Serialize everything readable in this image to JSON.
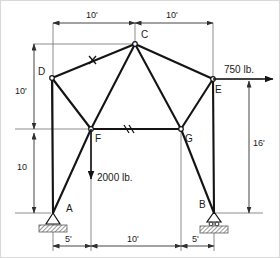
{
  "diagram": {
    "colors": {
      "member": "#141414",
      "dimension": "#3c3c3c",
      "ground_hatch": "#8a8a8a",
      "background": "#ffffff"
    },
    "joints": [
      {
        "id": "A",
        "label": "A",
        "x": 52,
        "y": 212,
        "support": "pin"
      },
      {
        "id": "B",
        "label": "B",
        "x": 213,
        "y": 212,
        "support": "roller"
      },
      {
        "id": "C",
        "label": "C",
        "x": 134,
        "y": 43,
        "support": "none"
      },
      {
        "id": "D",
        "label": "D",
        "x": 51,
        "y": 77,
        "support": "none"
      },
      {
        "id": "E",
        "label": "E",
        "x": 212,
        "y": 78,
        "support": "none"
      },
      {
        "id": "F",
        "label": "F",
        "x": 90,
        "y": 128,
        "support": "none"
      },
      {
        "id": "G",
        "label": "G",
        "x": 180,
        "y": 128,
        "support": "none"
      }
    ],
    "members": [
      {
        "from": "A",
        "to": "D",
        "mark": ""
      },
      {
        "from": "D",
        "to": "C",
        "mark": "x"
      },
      {
        "from": "C",
        "to": "E",
        "mark": ""
      },
      {
        "from": "E",
        "to": "B",
        "mark": ""
      },
      {
        "from": "D",
        "to": "F",
        "mark": ""
      },
      {
        "from": "F",
        "to": "C",
        "mark": ""
      },
      {
        "from": "C",
        "to": "G",
        "mark": ""
      },
      {
        "from": "G",
        "to": "E",
        "mark": ""
      },
      {
        "from": "F",
        "to": "G",
        "mark": "//"
      },
      {
        "from": "A",
        "to": "F",
        "mark": ""
      },
      {
        "from": "G",
        "to": "B",
        "mark": ""
      }
    ],
    "loads": [
      {
        "id": "load-750",
        "label": "750 lb.",
        "magnitude": 750,
        "unit": "lb.",
        "direction": "right",
        "at_joint": "E"
      },
      {
        "id": "load-2000",
        "label": "2000 lb.",
        "magnitude": 2000,
        "unit": "lb.",
        "direction": "down",
        "at_joint": "F"
      }
    ],
    "dimensions": [
      {
        "id": "dim-top-left",
        "label": "10'",
        "orientation": "horizontal",
        "position": "top"
      },
      {
        "id": "dim-top-right",
        "label": "10'",
        "orientation": "horizontal",
        "position": "top"
      },
      {
        "id": "dim-left-upper",
        "label": "10'",
        "orientation": "vertical",
        "position": "left"
      },
      {
        "id": "dim-left-lower",
        "label": "10",
        "orientation": "vertical",
        "position": "left"
      },
      {
        "id": "dim-right",
        "label": "16'",
        "orientation": "vertical",
        "position": "right"
      },
      {
        "id": "dim-bottom-left",
        "label": "5'",
        "orientation": "horizontal",
        "position": "bottom"
      },
      {
        "id": "dim-bottom-mid",
        "label": "10'",
        "orientation": "horizontal",
        "position": "bottom"
      },
      {
        "id": "dim-bottom-right",
        "label": "5'",
        "orientation": "horizontal",
        "position": "bottom"
      }
    ]
  }
}
